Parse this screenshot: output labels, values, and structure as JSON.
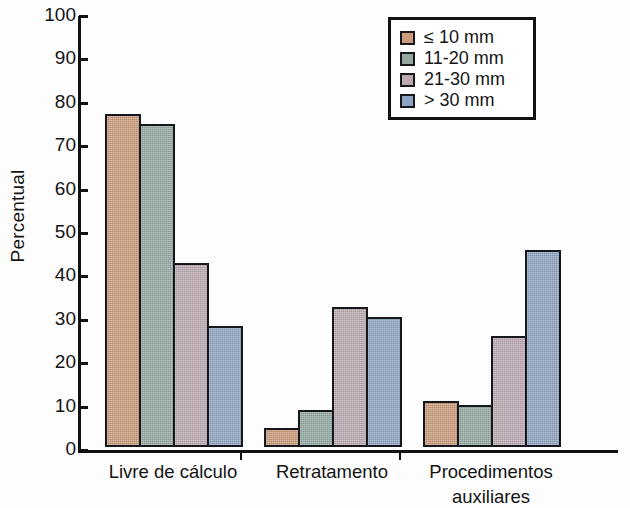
{
  "chart_data": {
    "type": "bar",
    "title": "",
    "xlabel": "",
    "ylabel": "Percentual",
    "ylim": [
      0,
      100
    ],
    "ytick_step": 10,
    "yticks": [
      100,
      90,
      80,
      70,
      60,
      50,
      40,
      30,
      20,
      10,
      0
    ],
    "grid": false,
    "legend_position": "top-right",
    "categories": [
      "Livre de cálculo",
      "Retratamento",
      "Procedimentos\nauxiliares"
    ],
    "series": [
      {
        "name": "≤ 10 mm",
        "color": "#cb9a79",
        "values": [
          76.7,
          4.4,
          10.6
        ]
      },
      {
        "name": "11-20 mm",
        "color": "#93a7a1",
        "values": [
          74.5,
          8.6,
          9.6
        ]
      },
      {
        "name": "21-30 mm",
        "color": "#bba9b2",
        "values": [
          42.4,
          32.2,
          25.6
        ]
      },
      {
        "name": "> 30 mm",
        "color": "#8ea4c0",
        "values": [
          27.8,
          29.9,
          45.3
        ]
      }
    ]
  },
  "legend": {
    "items": [
      {
        "label": "≤ 10 mm"
      },
      {
        "label": "11-20 mm"
      },
      {
        "label": "21-30 mm"
      },
      {
        "label": "> 30 mm"
      }
    ]
  },
  "axes": {
    "y_label": "Percentual",
    "y_tick_labels": [
      "100",
      "90",
      "80",
      "70",
      "60",
      "50",
      "40",
      "30",
      "20",
      "10",
      "0"
    ],
    "x_tick_labels": [
      "Livre de cálculo",
      "Retratamento",
      "Procedimentos\nauxiliares"
    ]
  },
  "colors": {
    "axis": "#121212",
    "bar_outline": "#16181d",
    "background": "#fdfdfd",
    "series_1": "#cb9a79",
    "series_2": "#93a7a1",
    "series_3": "#bba9b2",
    "series_4": "#8ea4c0"
  }
}
